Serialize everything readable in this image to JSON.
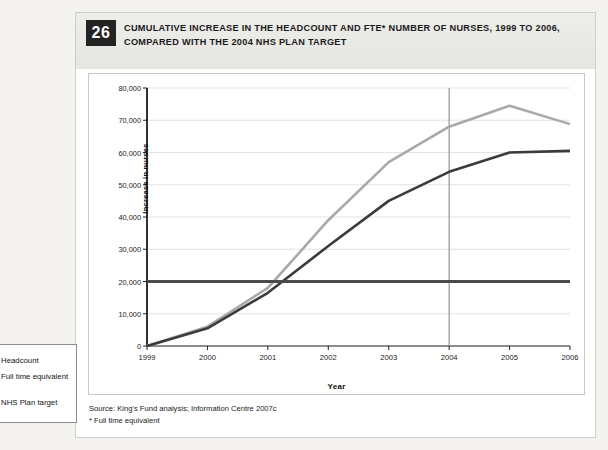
{
  "figure": {
    "number": "26",
    "title": "CUMULATIVE INCREASE IN THE HEADCOUNT AND FTE* NUMBER OF NURSES, 1999 TO 2006, COMPARED WITH THE 2004 NHS PLAN TARGET",
    "source_line1": "Source: King's Fund analysis; Information Centre 2007c",
    "source_line2": "* Full time equivalent"
  },
  "legend": {
    "items": [
      {
        "label": "Headcount",
        "color": "#a9a9a9"
      },
      {
        "label": "Full time equivalent",
        "color": "#3b3b3b"
      },
      {
        "label": "NHS Plan target",
        "color": "#4a4a4a"
      }
    ]
  },
  "chart_data": {
    "type": "line",
    "xlabel": "Year",
    "ylabel": "Increase in nurses",
    "x": [
      1999,
      2000,
      2001,
      2002,
      2003,
      2004,
      2005,
      2006
    ],
    "xtick_labels": [
      "1999",
      "2000",
      "2001",
      "2002",
      "2003",
      "2004",
      "2005",
      "2006"
    ],
    "ytick_labels": [
      "0",
      "10,000",
      "20,000",
      "30,000",
      "40,000",
      "50,000",
      "60,000",
      "70,000",
      "80,000"
    ],
    "ytick_values": [
      0,
      10000,
      20000,
      30000,
      40000,
      50000,
      60000,
      70000,
      80000
    ],
    "xlim": [
      1999,
      2006
    ],
    "ylim": [
      0,
      80000
    ],
    "grid": true,
    "legend_position": "left-outside",
    "annotations": [
      {
        "type": "vline",
        "x": 2004,
        "label": "2004 NHS Plan target year",
        "color": "#8a8a8a"
      }
    ],
    "series": [
      {
        "name": "Headcount",
        "color": "#a9a9a9",
        "width": 2.6,
        "values": [
          0,
          6000,
          18000,
          39000,
          57000,
          68000,
          74500,
          68800
        ]
      },
      {
        "name": "Full time equivalent",
        "color": "#3b3b3b",
        "width": 2.6,
        "values": [
          0,
          5500,
          16500,
          31000,
          45000,
          54000,
          60000,
          60500
        ]
      },
      {
        "name": "NHS Plan target",
        "color": "#4a4a4a",
        "width": 3.0,
        "constant": 20000,
        "values": [
          20000,
          20000,
          20000,
          20000,
          20000,
          20000,
          20000,
          20000
        ]
      }
    ]
  }
}
